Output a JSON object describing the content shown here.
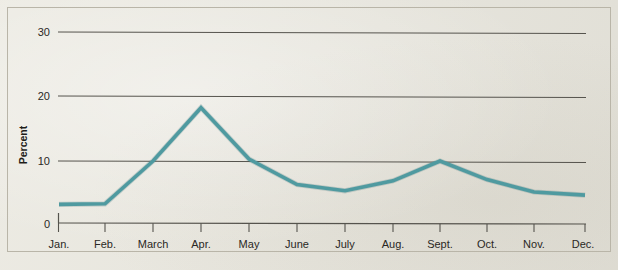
{
  "figure": {
    "background_color": "#e9e7de",
    "frame_color": "#b9b5a8"
  },
  "chart_data": {
    "type": "line",
    "title": "",
    "subtitle": "",
    "xlabel": "",
    "ylabel": "Percent",
    "categories": [
      "Jan.",
      "Feb.",
      "March",
      "Apr.",
      "May",
      "June",
      "July",
      "Aug.",
      "Sept.",
      "Oct.",
      "Nov.",
      "Dec."
    ],
    "values": [
      3.0,
      3.1,
      10.0,
      18.6,
      10.3,
      6.2,
      5.2,
      6.8,
      10.0,
      7.0,
      5.0,
      4.5
    ],
    "series": [
      {
        "name": "Percent",
        "color": "#4f9aa0",
        "values": [
          3.0,
          3.1,
          10.0,
          18.6,
          10.3,
          6.2,
          5.2,
          6.8,
          10.0,
          7.0,
          5.0,
          4.5
        ]
      }
    ],
    "ylim": [
      0,
      30
    ],
    "yticks": [
      0,
      10,
      20,
      30
    ],
    "ytick_labels": [
      "0",
      "10",
      "20",
      "30"
    ],
    "xtick_labels": [
      "Jan.",
      "Feb.",
      "March",
      "Apr.",
      "May",
      "June",
      "July",
      "Aug.",
      "Sept.",
      "Oct.",
      "Nov.",
      "Dec."
    ],
    "grid": "horizontal",
    "grid_color": "#55534d",
    "legend": "none",
    "line_color": "#4f9aa0",
    "annotations": []
  },
  "axes": {
    "y_label": "Percent",
    "y_ticks": [
      {
        "value": 30,
        "label": "30"
      },
      {
        "value": 20,
        "label": "20"
      },
      {
        "value": 10,
        "label": "10"
      },
      {
        "value": 0,
        "label": "0"
      }
    ],
    "x_ticks": [
      {
        "label": "Jan."
      },
      {
        "label": "Feb."
      },
      {
        "label": "March"
      },
      {
        "label": "Apr."
      },
      {
        "label": "May"
      },
      {
        "label": "June"
      },
      {
        "label": "July"
      },
      {
        "label": "Aug."
      },
      {
        "label": "Sept."
      },
      {
        "label": "Oct."
      },
      {
        "label": "Nov."
      },
      {
        "label": "Dec."
      }
    ]
  }
}
